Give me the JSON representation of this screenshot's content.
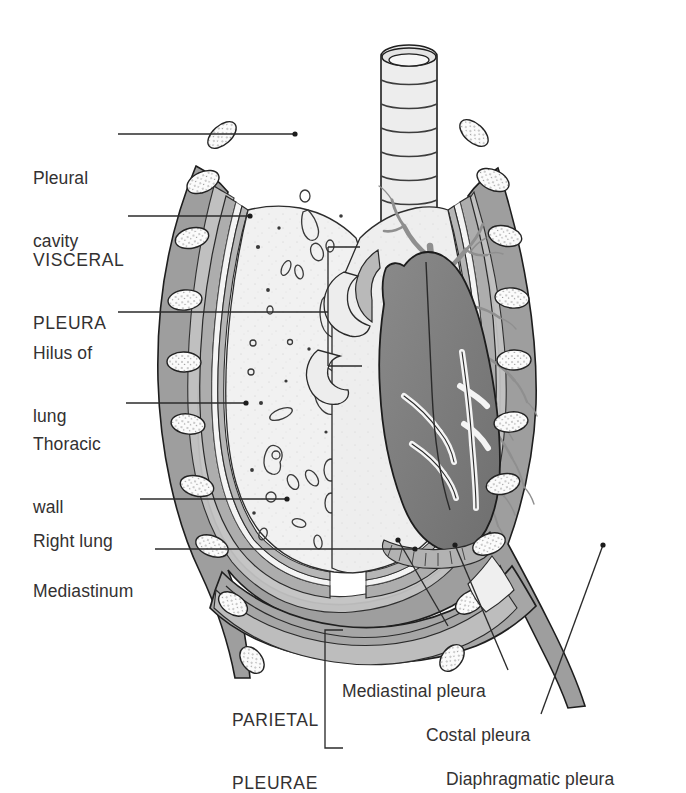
{
  "figure": {
    "type": "anatomical-diagram",
    "background_color": "#ffffff",
    "ink_color": "#333131",
    "palette": {
      "outline": "#1d1d1d",
      "thoracic_wall_gray": "#9b9b9b",
      "pleura_gray": "#b3b3b3",
      "lung_light": "#efefef",
      "lung_tint": "#e6e6e6",
      "heart_dark": "#7f7f7f",
      "bronchi_gray": "#9a9a9a",
      "rib_white": "#fbfbfb",
      "diaphragm_gray": "#a6a6a6",
      "leader_line": "#2b2b2b"
    }
  },
  "labels": {
    "left": [
      {
        "id": "pleural-cavity",
        "lines": [
          "Pleural",
          "cavity"
        ],
        "x": 33,
        "y": 126,
        "style": "title-case"
      },
      {
        "id": "visceral-pleura",
        "lines": [
          "VISCERAL",
          "PLEURA"
        ],
        "x": 33,
        "y": 208,
        "style": "upper-case"
      },
      {
        "id": "hilus-of-lung",
        "lines": [
          "Hilus of",
          "lung"
        ],
        "x": 33,
        "y": 306,
        "style": "title-case"
      },
      {
        "id": "thoracic-wall",
        "lines": [
          "Thoracic",
          "wall"
        ],
        "x": 33,
        "y": 396,
        "style": "title-case"
      },
      {
        "id": "right-lung",
        "lines": [
          "Right lung"
        ],
        "x": 33,
        "y": 491,
        "style": "title-case"
      },
      {
        "id": "mediastinum",
        "lines": [
          "Mediastinum"
        ],
        "x": 33,
        "y": 541,
        "style": "title-case"
      }
    ],
    "bottom": [
      {
        "id": "parietal-pleurae",
        "lines": [
          "PARIETAL",
          "PLEURAE"
        ],
        "x": 232,
        "y": 668,
        "style": "upper-case"
      },
      {
        "id": "mediastinal-pleura",
        "lines": [
          "Mediastinal pleura"
        ],
        "x": 342,
        "y": 639,
        "style": "title-case"
      },
      {
        "id": "costal-pleura",
        "lines": [
          "Costal pleura"
        ],
        "x": 426,
        "y": 683,
        "style": "title-case"
      },
      {
        "id": "diaphragmatic-pleura",
        "lines": [
          "Diaphragmatic pleura"
        ],
        "x": 446,
        "y": 727,
        "style": "title-case"
      }
    ]
  },
  "leaders": {
    "pleural_cavity": {
      "from": [
        118,
        134
      ],
      "to": [
        295,
        134
      ],
      "dot": [
        295,
        134
      ]
    },
    "visceral_pleura": {
      "from": [
        128,
        216
      ],
      "to": [
        250,
        216
      ],
      "dot": [
        250,
        216
      ]
    },
    "hilus_of_lung": {
      "from": [
        118,
        312
      ],
      "bracket_x": 328,
      "top_y": 247,
      "bottom_y": 366,
      "top_end": 360,
      "bottom_end": 362
    },
    "thoracic_wall": {
      "from": [
        126,
        403
      ],
      "to": [
        246,
        403
      ],
      "dot": [
        246,
        403
      ]
    },
    "right_lung": {
      "from": [
        140,
        499
      ],
      "to": [
        287,
        499
      ],
      "dot": [
        287,
        499
      ]
    },
    "mediastinum": {
      "from": [
        155,
        549
      ],
      "to": [
        415,
        549
      ],
      "dot": [
        415,
        549
      ]
    },
    "mediastinal_pleura": {
      "from": [
        448,
        628
      ],
      "to": [
        398,
        540
      ],
      "dot": [
        398,
        540
      ]
    },
    "costal_pleura": {
      "from": [
        505,
        672
      ],
      "to": [
        455,
        545
      ],
      "dot": [
        455,
        545
      ]
    },
    "diaphragmatic_pleura": {
      "from": [
        540,
        716
      ],
      "to": [
        602,
        545
      ],
      "dot": [
        602,
        545
      ]
    },
    "parietal_bracket": {
      "x": 325,
      "top_y": 630,
      "bottom_y": 748,
      "tick": 18
    }
  },
  "structures": [
    {
      "name": "trachea",
      "description": "central airway with cartilage rings"
    },
    {
      "name": "right-lung",
      "description": "cut surface showing vessel cross-sections"
    },
    {
      "name": "left-lung",
      "description": "bronchial tree branching"
    },
    {
      "name": "heart",
      "description": "dark grey mediastinal mass with coronary vessels"
    },
    {
      "name": "diaphragm",
      "description": "dome-shaped muscular floor"
    },
    {
      "name": "ribs",
      "description": "cross-sectioned ribs in thoracic wall"
    },
    {
      "name": "pleural-cavity",
      "description": "potential space between parietal and visceral pleurae"
    }
  ]
}
